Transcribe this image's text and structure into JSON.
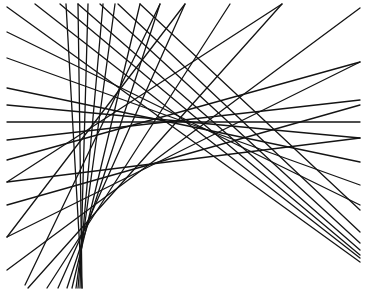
{
  "figure": {
    "stroke_color": "#141414",
    "background": "#ffffff",
    "lines": [
      {
        "x1": 7,
        "y1": 7,
        "x2": 360,
        "y2": 262
      },
      {
        "x1": 35,
        "y1": 4,
        "x2": 360,
        "y2": 258
      },
      {
        "x1": 60,
        "y1": 4,
        "x2": 360,
        "y2": 255
      },
      {
        "x1": 78,
        "y1": 4,
        "x2": 360,
        "y2": 250
      },
      {
        "x1": 100,
        "y1": 4,
        "x2": 360,
        "y2": 243
      },
      {
        "x1": 118,
        "y1": 4,
        "x2": 360,
        "y2": 232
      },
      {
        "x1": 140,
        "y1": 4,
        "x2": 360,
        "y2": 210
      },
      {
        "x1": 7,
        "y1": 32,
        "x2": 360,
        "y2": 205
      },
      {
        "x1": 7,
        "y1": 58,
        "x2": 360,
        "y2": 185
      },
      {
        "x1": 7,
        "y1": 88,
        "x2": 360,
        "y2": 162
      },
      {
        "x1": 7,
        "y1": 105,
        "x2": 360,
        "y2": 138
      },
      {
        "x1": 66,
        "y1": 4,
        "x2": 82,
        "y2": 288
      },
      {
        "x1": 78,
        "y1": 4,
        "x2": 82,
        "y2": 288
      },
      {
        "x1": 88,
        "y1": 4,
        "x2": 80,
        "y2": 288
      },
      {
        "x1": 103,
        "y1": 4,
        "x2": 78,
        "y2": 288
      },
      {
        "x1": 115,
        "y1": 4,
        "x2": 76,
        "y2": 288
      },
      {
        "x1": 140,
        "y1": 4,
        "x2": 72,
        "y2": 288
      },
      {
        "x1": 160,
        "y1": 4,
        "x2": 67,
        "y2": 288
      },
      {
        "x1": 185,
        "y1": 4,
        "x2": 58,
        "y2": 288
      },
      {
        "x1": 230,
        "y1": 4,
        "x2": 47,
        "y2": 288
      },
      {
        "x1": 282,
        "y1": 4,
        "x2": 28,
        "y2": 288
      },
      {
        "x1": 360,
        "y1": 8,
        "x2": 7,
        "y2": 270
      },
      {
        "x1": 360,
        "y1": 62,
        "x2": 7,
        "y2": 237
      },
      {
        "x1": 360,
        "y1": 105,
        "x2": 7,
        "y2": 205
      },
      {
        "x1": 360,
        "y1": 138,
        "x2": 7,
        "y2": 182
      },
      {
        "x1": 7,
        "y1": 122,
        "x2": 360,
        "y2": 122
      },
      {
        "x1": 7,
        "y1": 140,
        "x2": 360,
        "y2": 100
      },
      {
        "x1": 7,
        "y1": 160,
        "x2": 360,
        "y2": 62
      },
      {
        "x1": 7,
        "y1": 182,
        "x2": 282,
        "y2": 4
      },
      {
        "x1": 7,
        "y1": 237,
        "x2": 185,
        "y2": 4
      },
      {
        "x1": 25,
        "y1": 285,
        "x2": 160,
        "y2": 4
      }
    ]
  }
}
